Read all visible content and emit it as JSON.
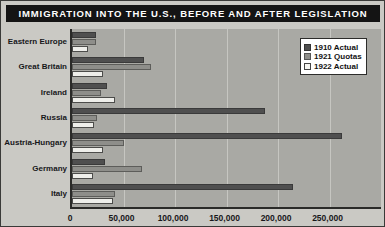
{
  "title": "IMMIGRATION INTO THE U.S., BEFORE AND AFTER LEGISLATION",
  "legend": {
    "position": "top-right",
    "entries": [
      {
        "label": "1910 Actual",
        "color": "#4f4f4f"
      },
      {
        "label": "1921 Quotas",
        "color": "#8e8e8a"
      },
      {
        "label": "1922 Actual",
        "color": "#eeeeea"
      }
    ]
  },
  "axis": {
    "x_ticks": [
      "0",
      "50,000",
      "100,000",
      "150,000",
      "200,000",
      "250,000"
    ],
    "x_tick_values": [
      0,
      50000,
      100000,
      150000,
      200000,
      250000
    ],
    "xmin": 0,
    "xmax": 300000,
    "xlabel": "",
    "ylabel": ""
  },
  "chart_data": {
    "type": "bar",
    "orientation": "horizontal",
    "title": "IMMIGRATION INTO THE U.S., BEFORE AND AFTER LEGISLATION",
    "xlabel": "",
    "ylabel": "",
    "xlim": [
      0,
      300000
    ],
    "grid": true,
    "legend_position": "top-right",
    "categories": [
      "Eastern Europe",
      "Great Britain",
      "Ireland",
      "Russia",
      "Austria-Hungary",
      "Germany",
      "Italy"
    ],
    "series": [
      {
        "name": "1910 Actual",
        "color": "#4f4f4f",
        "values": [
          23000,
          70000,
          34000,
          187000,
          262000,
          32000,
          215000
        ]
      },
      {
        "name": "1921 Quotas",
        "color": "#8e8e8a",
        "values": [
          23000,
          77000,
          28000,
          24000,
          50000,
          68000,
          42000
        ]
      },
      {
        "name": "1922 Actual",
        "color": "#eeeeea",
        "values": [
          16000,
          30000,
          42000,
          21000,
          30000,
          20000,
          40000
        ]
      }
    ]
  }
}
